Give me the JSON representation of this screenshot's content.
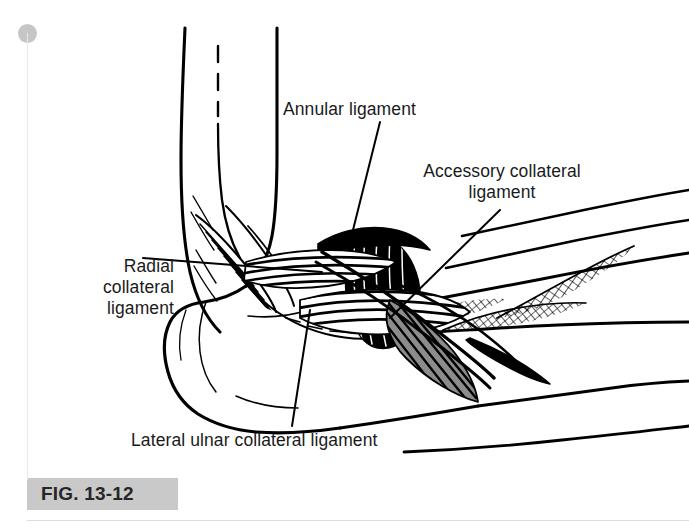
{
  "figure": {
    "caption": "FIG. 13-12",
    "banner_color": "#c9c9c9",
    "banner_text_color": "#262626",
    "background_color": "#ffffff",
    "ink_color": "#000000"
  },
  "labels": {
    "annular": "Annular ligament",
    "accessory": "Accessory collateral\nligament",
    "radial": "Radial\ncollateral\nligament",
    "lateral_ulnar": "Lateral ulnar collateral ligament"
  },
  "artifacts": {
    "scan_dot": "page-binding-dot",
    "scan_line_left": "page-edge-line",
    "scan_line_bottom": "page-edge-line"
  }
}
